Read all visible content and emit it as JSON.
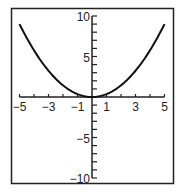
{
  "chart_data": {
    "type": "line",
    "title": "",
    "xlabel": "",
    "ylabel": "",
    "xlim": [
      -5,
      5
    ],
    "ylim": [
      -10,
      10
    ],
    "grid": false,
    "legend": null,
    "x_tick_labels": [
      "−5",
      "−3",
      "−1",
      "1",
      "3",
      "5"
    ],
    "x_tick_values": [
      -5,
      -3,
      -1,
      1,
      3,
      5
    ],
    "y_tick_labels": [
      "10",
      "5",
      "−5",
      "−10"
    ],
    "y_tick_values": [
      10,
      5,
      -5,
      -10
    ],
    "series": [
      {
        "name": "parabola",
        "function": "y = 0.36x^2",
        "x": [
          -5,
          -4,
          -3,
          -2,
          -1,
          0,
          1,
          2,
          3,
          4,
          5
        ],
        "values": [
          9,
          5.76,
          3.24,
          1.44,
          0.36,
          0,
          0.36,
          1.44,
          3.24,
          5.76,
          9
        ]
      }
    ],
    "colors": {
      "axis": "#222222",
      "curve": "#111111",
      "frame": "#222222"
    }
  }
}
